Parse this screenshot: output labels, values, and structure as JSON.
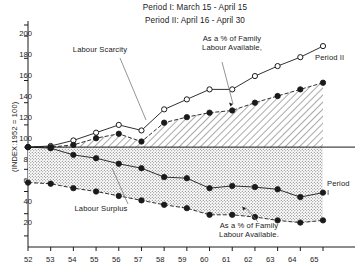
{
  "header": {
    "line1": "Period I: March 15 - April 15",
    "line2": "Period II: April 16 - April 30"
  },
  "annotations": {
    "labour_scarcity": "Labour Scarcity",
    "labour_surplus": "Labour Surplus",
    "pct_family_upper": "As a % of Family\nLabour Available,",
    "pct_family_lower": "As a % of Family\nLabour Available.",
    "period_two": "Period II",
    "period_one": "Period\nI"
  },
  "axes": {
    "ytitle": "(INDEX:1952 = 100)",
    "yticks": [
      20,
      40,
      60,
      80,
      100,
      120,
      140,
      160,
      180,
      200
    ],
    "xticks": [
      "52",
      "53",
      "54",
      "55",
      "56",
      "57",
      "58",
      "59",
      "60",
      "61",
      "62",
      "63",
      "64",
      "65"
    ]
  },
  "chart_data": {
    "type": "line",
    "xlabel": "",
    "ylabel": "(INDEX:1952 = 100)",
    "xlim": [
      52,
      65
    ],
    "ylim": [
      10,
      210
    ],
    "grid": false,
    "legend": "inline-annotations",
    "reference_line": 100,
    "x": [
      52,
      53,
      54,
      55,
      56,
      57,
      58,
      59,
      60,
      61,
      62,
      63,
      64,
      65
    ],
    "series": [
      {
        "name": "Labour Scarcity - Period II",
        "marker": "open-circle",
        "line": "solid",
        "values": [
          100,
          101,
          106,
          113,
          120,
          115,
          134,
          143,
          152,
          152,
          164,
          173,
          181,
          191
        ]
      },
      {
        "name": "Labour Scarcity - Period I (As a % of Family Labour Available)",
        "marker": "filled-circle",
        "line": "dashed",
        "values": [
          100,
          100,
          102,
          108,
          112,
          105,
          122,
          127,
          131,
          133,
          140,
          146,
          152,
          158
        ]
      },
      {
        "name": "Labour Surplus - Period I",
        "marker": "filled-circle",
        "line": "solid",
        "values": [
          100,
          99,
          93,
          90,
          85,
          81,
          73,
          72,
          63,
          65,
          64,
          62,
          55,
          59
        ]
      },
      {
        "name": "Labour Surplus - Period II (As a % of Family Labour Available)",
        "marker": "filled-circle",
        "line": "dashed",
        "values": [
          68,
          67,
          63,
          60,
          56,
          52,
          48,
          45,
          39,
          39,
          37,
          34,
          32,
          34
        ]
      }
    ]
  },
  "colors": {
    "ink": "#1a1a1a",
    "hatch": "#2b2b2b",
    "stipple": "#555555"
  }
}
